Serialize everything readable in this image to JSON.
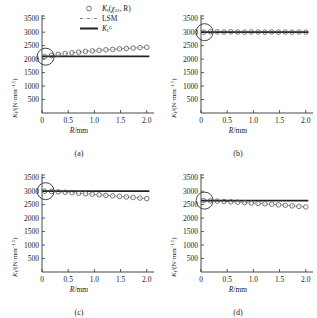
{
  "figure": {
    "panels": [
      {
        "id": "a",
        "caption": "(a)",
        "xlabel_italic": "R",
        "xlabel_rest": "/mm",
        "ylabel": "Kᴵ/(N·mm⁻¹·⁵)"
      },
      {
        "id": "b",
        "caption": "(b)",
        "xlabel_italic": "R",
        "xlabel_rest": "/mm",
        "ylabel": "Kᴵ/(N·mm⁻¹·⁵)"
      },
      {
        "id": "c",
        "caption": "(c)",
        "xlabel_italic": "R",
        "xlabel_rest": "/mm",
        "ylabel": "Kᴵ/(N·mm⁻¹·⁵)"
      },
      {
        "id": "d",
        "caption": "(d)",
        "xlabel_italic": "R",
        "xlabel_rest": "/mm",
        "ylabel": "Kᴵ/(N·mm⁻¹·⁵)"
      }
    ],
    "legend": {
      "position": "top-right-of-panel-a",
      "entries": [
        {
          "symbol": "circle-marker",
          "label_k": "K",
          "label_sub": "I",
          "label_arg": "(χ₂₂, R)"
        },
        {
          "symbol": "dashed-line",
          "label": "LSM"
        },
        {
          "symbol": "solid-line",
          "label_k": "K",
          "label_sub": "I",
          "label_sup": "G"
        }
      ]
    },
    "annotation": {
      "name": "circle-highlight",
      "description": "large open circle at left edge of each plot"
    }
  },
  "chart_data": [
    {
      "type": "scatter",
      "panel": "a",
      "title": "",
      "xlabel": "R/mm",
      "ylabel": "K_I/(N·mm^-1.5)",
      "xlim": [
        0,
        2.1
      ],
      "ylim": [
        0,
        3600
      ],
      "xticks": [
        0,
        0.5,
        1.0,
        1.5,
        2.0
      ],
      "xticklabels": [
        "0",
        "0.5",
        "1.0",
        "1.5",
        "2.0"
      ],
      "yticks": [
        500,
        1000,
        1500,
        2000,
        2500,
        3000,
        3500
      ],
      "yticklabels": [
        "500",
        "1000",
        "1500",
        "2000",
        "2500",
        "3000",
        "3500"
      ],
      "grid": false,
      "legend": "none",
      "series": [
        {
          "name": "K_I(chi22, R)",
          "style": "open-circle-markers",
          "x": [
            0.05,
            0.18,
            0.31,
            0.44,
            0.57,
            0.7,
            0.83,
            0.96,
            1.09,
            1.22,
            1.35,
            1.48,
            1.61,
            1.74,
            1.87,
            2.0
          ],
          "y": [
            2090,
            2135,
            2175,
            2205,
            2235,
            2260,
            2285,
            2305,
            2325,
            2345,
            2360,
            2380,
            2395,
            2410,
            2425,
            2440
          ]
        },
        {
          "name": "LSM",
          "style": "dash-dot-line",
          "x": [
            0.05,
            2.0
          ],
          "y": [
            2100,
            2440
          ]
        },
        {
          "name": "K_I^G",
          "style": "solid-line",
          "x": [
            0.0,
            2.05
          ],
          "y": [
            2100,
            2100
          ]
        }
      ]
    },
    {
      "type": "scatter",
      "panel": "b",
      "title": "",
      "xlabel": "R/mm",
      "ylabel": "K_I/(N·mm^-1.5)",
      "xlim": [
        0,
        2.1
      ],
      "ylim": [
        0,
        3600
      ],
      "xticks": [
        0,
        0.5,
        1.0,
        1.5,
        2.0
      ],
      "xticklabels": [
        "0",
        "0.5",
        "1.0",
        "1.5",
        "2.0"
      ],
      "yticks": [
        500,
        1000,
        1500,
        2000,
        2500,
        3000,
        3500
      ],
      "yticklabels": [
        "500",
        "1000",
        "1500",
        "2000",
        "2500",
        "3000",
        "3500"
      ],
      "grid": false,
      "legend": "none",
      "series": [
        {
          "name": "K_I(chi22, R)",
          "style": "open-circle-markers",
          "x": [
            0.05,
            0.18,
            0.31,
            0.44,
            0.57,
            0.7,
            0.83,
            0.96,
            1.09,
            1.22,
            1.35,
            1.48,
            1.61,
            1.74,
            1.87,
            2.0
          ],
          "y": [
            3000,
            3015,
            3010,
            3005,
            3015,
            3005,
            3000,
            3010,
            3005,
            3000,
            3010,
            3000,
            3005,
            3000,
            3005,
            3000
          ]
        },
        {
          "name": "LSM",
          "style": "dash-dot-line",
          "x": [
            0.05,
            2.0
          ],
          "y": [
            3005,
            3005
          ]
        },
        {
          "name": "K_I^G",
          "style": "solid-line",
          "x": [
            0.0,
            2.05
          ],
          "y": [
            3000,
            3000
          ]
        }
      ]
    },
    {
      "type": "scatter",
      "panel": "c",
      "title": "",
      "xlabel": "R/mm",
      "ylabel": "K_I/(N·mm^-1.5)",
      "xlim": [
        0,
        2.1
      ],
      "ylim": [
        0,
        3600
      ],
      "xticks": [
        0,
        0.5,
        1.0,
        1.5,
        2.0
      ],
      "xticklabels": [
        "0",
        "0.5",
        "1.0",
        "1.5",
        "2.0"
      ],
      "yticks": [
        500,
        1000,
        1500,
        2000,
        2500,
        3000,
        3500
      ],
      "yticklabels": [
        "500",
        "1000",
        "1500",
        "2000",
        "2500",
        "3000",
        "3500"
      ],
      "grid": false,
      "legend": "none",
      "series": [
        {
          "name": "K_I(chi22, R)",
          "style": "open-circle-markers",
          "x": [
            0.05,
            0.18,
            0.31,
            0.44,
            0.57,
            0.7,
            0.83,
            0.96,
            1.09,
            1.22,
            1.35,
            1.48,
            1.61,
            1.74,
            1.87,
            2.0
          ],
          "y": [
            3000,
            2990,
            2975,
            2960,
            2945,
            2925,
            2905,
            2885,
            2865,
            2845,
            2825,
            2805,
            2785,
            2765,
            2745,
            2725
          ]
        },
        {
          "name": "LSM",
          "style": "dash-dot-line",
          "x": [
            0.05,
            2.0
          ],
          "y": [
            3000,
            2725
          ]
        },
        {
          "name": "K_I^G",
          "style": "solid-line",
          "x": [
            0.0,
            2.05
          ],
          "y": [
            3000,
            3000
          ]
        }
      ]
    },
    {
      "type": "scatter",
      "panel": "d",
      "title": "",
      "xlabel": "R/mm",
      "ylabel": "K_I/(N·mm^-1.5)",
      "xlim": [
        0,
        2.1
      ],
      "ylim": [
        0,
        3600
      ],
      "xticks": [
        0,
        0.5,
        1.0,
        1.5,
        2.0
      ],
      "xticklabels": [
        "0",
        "0.5",
        "1.0",
        "1.5",
        "2.0"
      ],
      "yticks": [
        500,
        1000,
        1500,
        2000,
        2500,
        3000,
        3500
      ],
      "yticklabels": [
        "500",
        "1000",
        "1500",
        "2000",
        "2500",
        "3000",
        "3500"
      ],
      "grid": false,
      "legend": "none",
      "series": [
        {
          "name": "K_I(chi22, R)",
          "style": "open-circle-markers",
          "x": [
            0.05,
            0.18,
            0.31,
            0.44,
            0.57,
            0.7,
            0.83,
            0.96,
            1.09,
            1.22,
            1.35,
            1.48,
            1.61,
            1.74,
            1.87,
            2.0
          ],
          "y": [
            2650,
            2640,
            2630,
            2620,
            2605,
            2590,
            2575,
            2560,
            2545,
            2530,
            2515,
            2495,
            2475,
            2455,
            2435,
            2415
          ]
        },
        {
          "name": "LSM",
          "style": "dash-dot-line",
          "x": [
            0.05,
            2.0
          ],
          "y": [
            2650,
            2415
          ]
        },
        {
          "name": "K_I^G",
          "style": "solid-line",
          "x": [
            0.0,
            2.05
          ],
          "y": [
            2650,
            2650
          ]
        }
      ]
    }
  ]
}
